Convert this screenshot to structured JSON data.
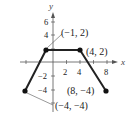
{
  "graph": {
    "axes": {
      "x_label": "x",
      "y_label": "y"
    },
    "x_ticks": [
      {
        "value": -2,
        "label": "−2"
      },
      {
        "value": 2,
        "label": "2"
      },
      {
        "value": 4,
        "label": "4"
      },
      {
        "value": 8,
        "label": "8"
      }
    ],
    "y_ticks": [
      {
        "value": 6,
        "label": "6"
      },
      {
        "value": 4,
        "label": "4"
      },
      {
        "value": -2,
        "label": "−2"
      },
      {
        "value": -4,
        "label": "−4"
      }
    ],
    "points": [
      {
        "x": -4,
        "y": -4,
        "label": "(−4, −4)"
      },
      {
        "x": -1,
        "y": 2,
        "label": "(−1, 2)"
      },
      {
        "x": 4,
        "y": 2,
        "label": "(4, 2)"
      },
      {
        "x": 8,
        "y": -4,
        "label": "(8, −4)"
      }
    ],
    "line_color": "#222222"
  }
}
